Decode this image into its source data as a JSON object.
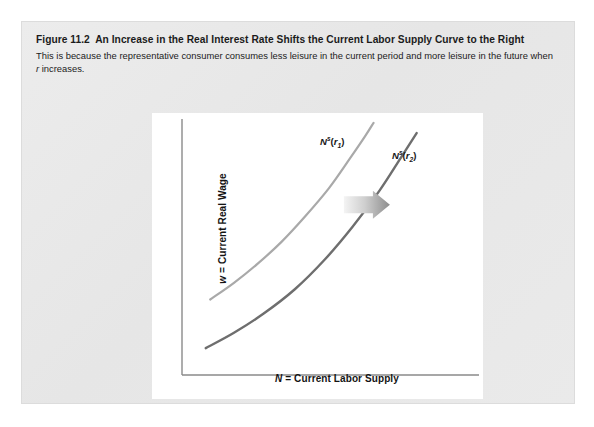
{
  "figure": {
    "number_label": "Figure 11.2",
    "title": "An Increase in the Real Interest Rate Shifts the Current Labor Supply Curve to the Right",
    "description_part1": "This is because the representative consumer consumes less leisure in the current period and more leisure in the future when ",
    "description_italic": "r",
    "description_part2": " increases.",
    "card_color": "#e9e9e9",
    "panel_color": "#ffffff"
  },
  "chart_data": {
    "type": "line",
    "title": "An Increase in the Real Interest Rate Shifts the Current Labor Supply Curve to the Right",
    "xlabel": "N = Current Labor Supply",
    "xlabel_symbol": "N",
    "xlabel_rest": " = Current Labor Supply",
    "ylabel": "w = Current Real Wage",
    "ylabel_symbol": "w",
    "ylabel_rest": " = Current Real Wage",
    "grid": false,
    "axis_ticks": false,
    "xlim": [
      0,
      1
    ],
    "ylim": [
      0,
      1
    ],
    "legend_position": "inline-curve-labels",
    "series": [
      {
        "name": "N^s(r_1)",
        "label_base": "N",
        "label_sup": "s",
        "label_sub": "1",
        "label_var": "r",
        "color": "#a9a9a9",
        "stroke_width": 2.2,
        "points": [
          [
            0.095,
            0.295
          ],
          [
            0.175,
            0.36
          ],
          [
            0.255,
            0.435
          ],
          [
            0.335,
            0.52
          ],
          [
            0.415,
            0.62
          ],
          [
            0.495,
            0.73
          ],
          [
            0.565,
            0.845
          ],
          [
            0.615,
            0.93
          ],
          [
            0.645,
            0.985
          ]
        ]
      },
      {
        "name": "N^s(r_2)",
        "label_base": "N",
        "label_sup": "s",
        "label_sub": "2",
        "label_var": "r",
        "color": "#6e6e6e",
        "stroke_width": 2.4,
        "points": [
          [
            0.08,
            0.105
          ],
          [
            0.175,
            0.165
          ],
          [
            0.275,
            0.24
          ],
          [
            0.38,
            0.335
          ],
          [
            0.48,
            0.45
          ],
          [
            0.575,
            0.58
          ],
          [
            0.665,
            0.72
          ],
          [
            0.735,
            0.845
          ],
          [
            0.79,
            0.945
          ]
        ]
      }
    ],
    "annotations": [
      {
        "type": "shift-arrow",
        "name": "rightward-shift-arrow",
        "direction": "right",
        "color_from": "#f0f0f0",
        "color_to": "#8d8d8d",
        "x_start": 0.545,
        "x_end": 0.7,
        "y": 0.665
      }
    ],
    "axis_color": "#8a8a8a"
  }
}
